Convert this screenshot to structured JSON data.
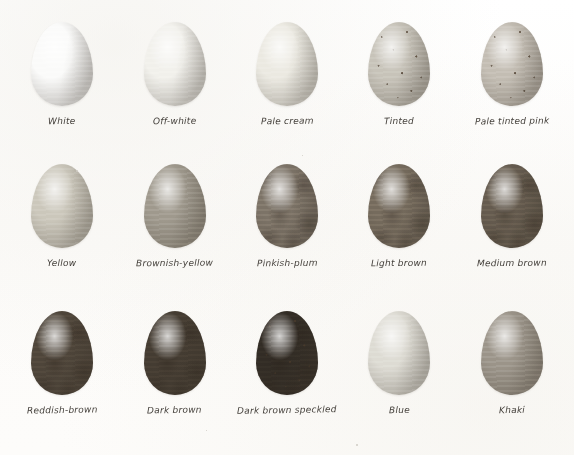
{
  "page": {
    "background_color": "#fdfdfc",
    "label_color": "#45413c",
    "columns": 5,
    "rows": 3
  },
  "eggs": [
    {
      "label": "White",
      "row": 1,
      "column": 1,
      "color": "#fbfbfa",
      "shell_tone": "pure white",
      "speckled": false,
      "mottled": false
    },
    {
      "label": "Off-white",
      "row": 1,
      "column": 2,
      "color": "#f2f1ec",
      "shell_tone": "off white with grey shading",
      "speckled": false,
      "mottled": false
    },
    {
      "label": "Pale cream",
      "row": 1,
      "column": 3,
      "color": "#eceae2",
      "shell_tone": "pale cream",
      "speckled": false,
      "mottled": false
    },
    {
      "label": "Tinted",
      "row": 1,
      "column": 4,
      "color": "#c8c4ba",
      "shell_tone": "grey tinted with dark speckles",
      "speckled": true,
      "mottled": false
    },
    {
      "label": "Pale tinted pink",
      "row": 1,
      "column": 5,
      "color": "#c4beb4",
      "shell_tone": "pale pink tint with speckles",
      "speckled": true,
      "mottled": false
    },
    {
      "label": "Yellow",
      "row": 2,
      "column": 1,
      "color": "#ccc8bc",
      "shell_tone": "pale yellow",
      "speckled": false,
      "mottled": false
    },
    {
      "label": "Brownish-yellow",
      "row": 2,
      "column": 2,
      "color": "#a09a8e",
      "shell_tone": "brownish yellow",
      "speckled": false,
      "mottled": false
    },
    {
      "label": "Pinkish-plum",
      "row": 2,
      "column": 3,
      "color": "#7d7468",
      "shell_tone": "pinkish plum",
      "speckled": false,
      "mottled": true
    },
    {
      "label": "Light brown",
      "row": 2,
      "column": 4,
      "color": "#766c5e",
      "shell_tone": "light brown, blotchy",
      "speckled": false,
      "mottled": true
    },
    {
      "label": "Medium brown",
      "row": 2,
      "column": 5,
      "color": "#665c4f",
      "shell_tone": "medium brown, blotchy",
      "speckled": false,
      "mottled": true
    },
    {
      "label": "Reddish-brown",
      "row": 3,
      "column": 1,
      "color": "#4e453a",
      "shell_tone": "deep reddish brown",
      "speckled": false,
      "mottled": true
    },
    {
      "label": "Dark brown",
      "row": 3,
      "column": 2,
      "color": "#443c32",
      "shell_tone": "dark brown",
      "speckled": false,
      "mottled": true
    },
    {
      "label": "Dark brown speckled",
      "row": 3,
      "column": 3,
      "color": "#322c25",
      "shell_tone": "very dark brown, heavily speckled",
      "speckled": true,
      "mottled": true
    },
    {
      "label": "Blue",
      "row": 3,
      "column": 4,
      "color": "#dedcd4",
      "shell_tone": "pale blue",
      "speckled": false,
      "mottled": false
    },
    {
      "label": "Khaki",
      "row": 3,
      "column": 5,
      "color": "#9c958a",
      "shell_tone": "khaki olive",
      "speckled": false,
      "mottled": false
    }
  ],
  "dust_specks": [
    {
      "x": 76,
      "y": 170,
      "size": 2
    },
    {
      "x": 79,
      "y": 173,
      "size": 1
    },
    {
      "x": 356,
      "y": 444,
      "size": 2
    },
    {
      "x": 206,
      "y": 430,
      "size": 1
    },
    {
      "x": 302,
      "y": 155,
      "size": 1
    }
  ]
}
